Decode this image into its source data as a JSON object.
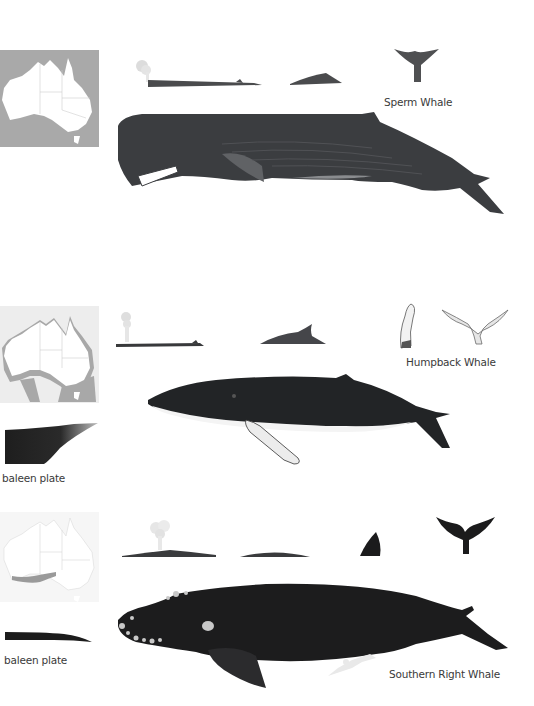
{
  "plate": {
    "sections": [
      {
        "id": "sperm",
        "name": "Sperm Whale",
        "map": {
          "style": "full-range",
          "sea_color": "#a9a9a9",
          "land_color": "#ffffff"
        },
        "icons": [
          "blow-and-back-silhouette",
          "dorsal-hump-silhouette",
          "tail-fluke-silhouette"
        ],
        "body_color": "#3b3d40"
      },
      {
        "id": "humpback",
        "name": "Humpback Whale",
        "map": {
          "style": "coastal-range",
          "sea_color": "#ededed",
          "range_color": "#a8a8a8",
          "land_color": "#ffffff"
        },
        "icons": [
          "blow-and-back-silhouette",
          "dorsal-fin-silhouette",
          "pectoral-fin-drawing",
          "tail-fluke-drawing"
        ],
        "baleen_label": "baleen plate",
        "body_color": "#222426"
      },
      {
        "id": "southern-right",
        "name": "Southern Right Whale",
        "map": {
          "style": "southern-range",
          "sea_color": "#f6f6f6",
          "range_color": "#9a9a9a",
          "land_color": "#ffffff"
        },
        "icons": [
          "v-blow-and-back-silhouette",
          "back-hump-silhouette",
          "fluke-tip-silhouette",
          "tail-fluke-silhouette"
        ],
        "baleen_label": "baleen plate",
        "body_color": "#1c1c1d"
      }
    ]
  }
}
